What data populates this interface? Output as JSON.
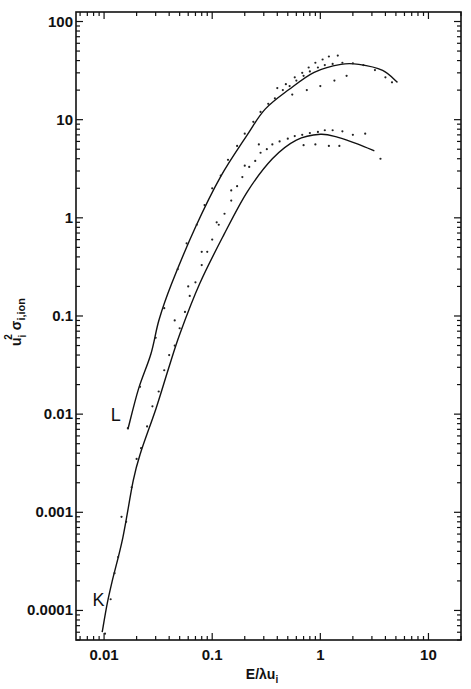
{
  "chart_data": {
    "type": "scatter",
    "title": "",
    "xlabel": "E/λu",
    "xlabel_sub": "i",
    "ylabel_main": "u",
    "ylabel_sup": "2",
    "ylabel_sub": "i",
    "ylabel_sigma": "σ",
    "ylabel_sigma_sub": "i,ion",
    "xscale": "log",
    "yscale": "log",
    "xlim": [
      0.0055,
      20
    ],
    "ylim": [
      5e-05,
      125
    ],
    "grid": false,
    "legend": "none",
    "x_ticks": [
      {
        "value": 0.01,
        "label": "0.01"
      },
      {
        "value": 0.1,
        "label": "0.1"
      },
      {
        "value": 1,
        "label": "1"
      },
      {
        "value": 10,
        "label": "10"
      }
    ],
    "y_ticks": [
      {
        "value": 100,
        "label": "100"
      },
      {
        "value": 10,
        "label": "10"
      },
      {
        "value": 1,
        "label": "1"
      },
      {
        "value": 0.1,
        "label": "0.1"
      },
      {
        "value": 0.01,
        "label": "0.01"
      },
      {
        "value": 0.001,
        "label": "0.001"
      },
      {
        "value": 0.0001,
        "label": "0.0001"
      }
    ],
    "series": [
      {
        "name": "L",
        "label": "L",
        "label_at": {
          "x": 0.0115,
          "y": 0.0085
        },
        "curve": {
          "x": [
            0.0166,
            0.0208,
            0.0271,
            0.0323,
            0.0422,
            0.0703,
            0.119,
            0.211,
            0.309,
            0.517,
            0.877,
            1.55,
            2.27,
            3.77,
            5.17
          ],
          "y": [
            0.007,
            0.018,
            0.041,
            0.092,
            0.214,
            0.81,
            2.6,
            7.0,
            12.8,
            20.4,
            30.4,
            36.6,
            36.6,
            31.8,
            24.0
          ]
        },
        "points": {
          "x": [
            0.0166,
            0.0215,
            0.03,
            0.036,
            0.048,
            0.058,
            0.072,
            0.085,
            0.1,
            0.12,
            0.14,
            0.17,
            0.2,
            0.24,
            0.28,
            0.33,
            0.38,
            0.45,
            0.52,
            0.6,
            0.7,
            0.8,
            0.95,
            1.1,
            1.3,
            1.6,
            2.0,
            2.5,
            3.2,
            4.0,
            4.6,
            0.4,
            0.48,
            0.58,
            0.68,
            0.78,
            0.9,
            1.05,
            1.2,
            1.45,
            0.55,
            0.75,
            1.0,
            1.35,
            1.75
          ],
          "y": [
            0.0072,
            0.019,
            0.06,
            0.12,
            0.3,
            0.55,
            0.85,
            1.35,
            2.0,
            2.7,
            3.9,
            5.4,
            7.2,
            9.5,
            12.0,
            14.5,
            16.5,
            20.0,
            22.0,
            25.0,
            28.0,
            31.0,
            34.0,
            36.0,
            37.0,
            38.0,
            37.5,
            36.0,
            32.0,
            27.0,
            24.0,
            21.0,
            23.0,
            27.0,
            30.0,
            34.0,
            38.0,
            41.0,
            44.0,
            45.0,
            18.0,
            20.0,
            22.0,
            25.0,
            28.0
          ]
        }
      },
      {
        "name": "K",
        "label": "K",
        "label_at": {
          "x": 0.0078,
          "y": 0.00011
        },
        "curve": {
          "x": [
            0.0096,
            0.0107,
            0.0119,
            0.0149,
            0.0186,
            0.0217,
            0.0303,
            0.0394,
            0.0503,
            0.0767,
            0.128,
            0.211,
            0.36,
            0.6,
            1.0,
            1.46,
            2.26,
            3.16
          ],
          "y": [
            6e-05,
            0.000118,
            0.0002,
            0.00055,
            0.0021,
            0.004,
            0.0115,
            0.029,
            0.066,
            0.214,
            0.67,
            1.84,
            4.0,
            6.2,
            7.1,
            6.6,
            5.6,
            4.8
          ]
        },
        "points": {
          "x": [
            0.0102,
            0.0115,
            0.0125,
            0.0135,
            0.0145,
            0.016,
            0.018,
            0.02,
            0.022,
            0.025,
            0.028,
            0.032,
            0.036,
            0.04,
            0.045,
            0.05,
            0.056,
            0.062,
            0.07,
            0.08,
            0.09,
            0.1,
            0.115,
            0.13,
            0.15,
            0.17,
            0.19,
            0.22,
            0.25,
            0.28,
            0.32,
            0.36,
            0.42,
            0.5,
            0.58,
            0.68,
            0.8,
            0.95,
            1.1,
            1.3,
            1.6,
            2.0,
            2.6,
            3.6,
            0.045,
            0.06,
            0.08,
            0.11,
            0.15,
            0.2,
            0.27,
            0.7,
            0.9,
            1.2,
            1.5
          ],
          "y": [
            5.8e-05,
            0.00013,
            0.00024,
            0.00035,
            0.0009,
            0.0008,
            0.0018,
            0.0035,
            0.0045,
            0.0075,
            0.012,
            0.017,
            0.028,
            0.04,
            0.05,
            0.075,
            0.11,
            0.16,
            0.22,
            0.33,
            0.45,
            0.6,
            0.85,
            1.1,
            1.5,
            2.1,
            2.6,
            3.3,
            3.8,
            4.6,
            5.0,
            5.6,
            6.0,
            6.4,
            6.8,
            7.0,
            7.3,
            7.5,
            7.8,
            7.8,
            7.6,
            7.0,
            7.2,
            4.0,
            0.09,
            0.2,
            0.45,
            0.9,
            1.9,
            3.4,
            5.6,
            5.5,
            5.6,
            5.4,
            5.4
          ]
        }
      }
    ]
  }
}
